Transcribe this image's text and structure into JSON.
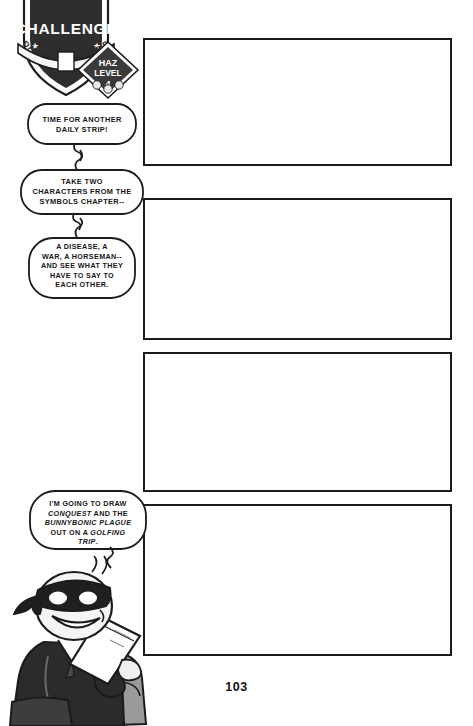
{
  "page": {
    "number": "103",
    "background_color": "#ffffff",
    "ink_color": "#1b1b1b"
  },
  "badge": {
    "title": "CHALLENGE",
    "banner": "DAILY SYMBOL STRIP",
    "haz_line_1": "HAZ",
    "haz_line_2": "LEVEL",
    "haz_level": "4",
    "shield_color": "#2e2e2e",
    "star_left": "★",
    "star_right": "★"
  },
  "bubbles": [
    {
      "id": "bubble-1",
      "lines": [
        "TIME FOR ANOTHER",
        "DAILY STRIP!"
      ]
    },
    {
      "id": "bubble-2",
      "lines": [
        "TAKE TWO",
        "CHARACTERS FROM THE",
        "SYMBOLS CHAPTER--"
      ]
    },
    {
      "id": "bubble-3",
      "lines": [
        "A DISEASE, A",
        "WAR, A HORSEMAN--",
        "AND SEE WHAT THEY",
        "HAVE TO SAY TO",
        "EACH OTHER."
      ]
    },
    {
      "id": "bubble-4",
      "lines_html": [
        "I'M GOING TO DRAW",
        "<em>CONQUEST</em> AND THE",
        "<em>BUNNYBONIC PLAGUE</em>",
        "OUT ON A <em>GOLFING</em>",
        "<em>TRIP</em>."
      ]
    }
  ],
  "panels": [
    {
      "id": "panel-1",
      "label": "Empty comic panel 1"
    },
    {
      "id": "panel-2",
      "label": "Empty comic panel 2"
    },
    {
      "id": "panel-3",
      "label": "Empty comic panel 3"
    },
    {
      "id": "panel-4",
      "label": "Empty comic panel 4"
    }
  ],
  "character": {
    "name": "masked-cartoonist",
    "description": "Masked character in dark suit seated reading a book"
  }
}
